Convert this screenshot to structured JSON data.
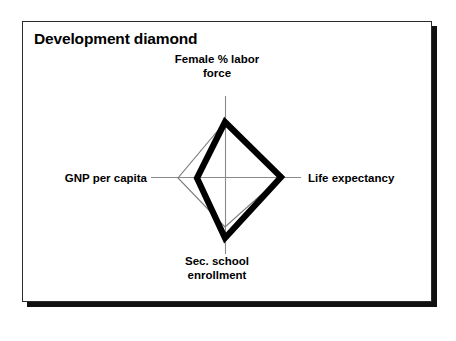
{
  "figure": {
    "title": "Development diamond",
    "frame_color": "#2b2b2b",
    "shadow_color": "#111111",
    "background": "#ffffff"
  },
  "chart_data": {
    "type": "radar",
    "title": "Development diamond",
    "xlabel": "",
    "ylabel": "",
    "grid": false,
    "legend_position": "none",
    "axes": [
      {
        "key": "female_labor_force",
        "label": "Female % labor force",
        "label_lines": [
          "Female % labor",
          "force"
        ],
        "position": "top",
        "angle_deg": 90
      },
      {
        "key": "life_expectancy",
        "label": "Life expectancy",
        "label_lines": [
          "Life expectancy"
        ],
        "position": "right",
        "angle_deg": 0
      },
      {
        "key": "sec_school_enrollment",
        "label": "Sec. school enrollment",
        "label_lines": [
          "Sec. school",
          "enrollment"
        ],
        "position": "bottom",
        "angle_deg": 270
      },
      {
        "key": "gnp_per_capita",
        "label": "GNP per capita",
        "label_lines": [
          "GNP per capita"
        ],
        "position": "left",
        "angle_deg": 180
      }
    ],
    "categories": [
      "Female % labor force",
      "Life expectancy",
      "Sec. school enrollment",
      "GNP per capita"
    ],
    "axis_max": 1.0,
    "series": [
      {
        "name": "country",
        "style": "thick-black",
        "color": "#000000",
        "line_width": 6,
        "values": [
          0.7,
          0.73,
          0.79,
          0.38
        ]
      },
      {
        "name": "reference-group",
        "style": "thin-gray",
        "color": "#7a7a7a",
        "line_width": 1,
        "values": [
          0.7,
          0.73,
          0.65,
          0.64
        ]
      }
    ],
    "axis_line_color": "#8a8a8a"
  },
  "geometry": {
    "center": {
      "x": 203,
      "y": 155
    },
    "axis_ends": {
      "top": {
        "x": 203,
        "y": 74
      },
      "right": {
        "x": 278,
        "y": 155
      },
      "bottom": {
        "x": 203,
        "y": 232
      },
      "left": {
        "x": 128,
        "y": 155
      }
    },
    "thick_polygon": [
      {
        "x": 202,
        "y": 100
      },
      {
        "x": 258,
        "y": 155
      },
      {
        "x": 202,
        "y": 216
      },
      {
        "x": 174,
        "y": 156
      }
    ],
    "thin_polygon": [
      {
        "x": 202,
        "y": 100
      },
      {
        "x": 258,
        "y": 155
      },
      {
        "x": 202,
        "y": 205
      },
      {
        "x": 155,
        "y": 156
      }
    ]
  }
}
